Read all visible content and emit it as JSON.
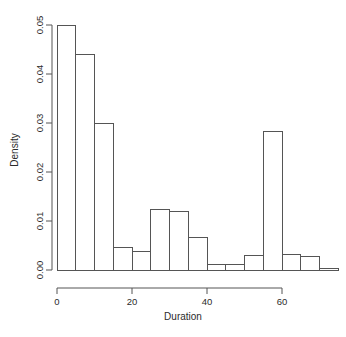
{
  "chart_data": {
    "type": "bar",
    "subtype": "histogram",
    "title": "",
    "xlabel": "Duration",
    "ylabel": "Density",
    "xlim": [
      0,
      75
    ],
    "ylim": [
      0,
      0.05
    ],
    "grid": false,
    "legend": null,
    "bin_width": 5,
    "bar_fill": "#ffffff",
    "bar_stroke": "#555555",
    "axis_color": "#555555",
    "xticks": [
      0,
      20,
      40,
      60
    ],
    "xtick_labels": [
      "0",
      "20",
      "40",
      "60"
    ],
    "yticks": [
      0,
      0.01,
      0.02,
      0.03,
      0.04,
      0.05
    ],
    "ytick_labels": [
      "0.00",
      "0.01",
      "0.02",
      "0.03",
      "0.04",
      "0.05"
    ],
    "bins": [
      {
        "x0": 0,
        "x1": 5,
        "density": 0.05
      },
      {
        "x0": 5,
        "x1": 10,
        "density": 0.044
      },
      {
        "x0": 10,
        "x1": 15,
        "density": 0.03
      },
      {
        "x0": 15,
        "x1": 20,
        "density": 0.0045
      },
      {
        "x0": 20,
        "x1": 25,
        "density": 0.0037
      },
      {
        "x0": 25,
        "x1": 30,
        "density": 0.0124
      },
      {
        "x0": 30,
        "x1": 35,
        "density": 0.012
      },
      {
        "x0": 35,
        "x1": 40,
        "density": 0.0067
      },
      {
        "x0": 40,
        "x1": 45,
        "density": 0.0011
      },
      {
        "x0": 45,
        "x1": 50,
        "density": 0.0012
      },
      {
        "x0": 50,
        "x1": 55,
        "density": 0.003
      },
      {
        "x0": 55,
        "x1": 60,
        "density": 0.0283
      },
      {
        "x0": 60,
        "x1": 65,
        "density": 0.0032
      },
      {
        "x0": 65,
        "x1": 70,
        "density": 0.0027
      },
      {
        "x0": 70,
        "x1": 75,
        "density": 0.0004
      }
    ],
    "categories": [
      "0-5",
      "5-10",
      "10-15",
      "15-20",
      "20-25",
      "25-30",
      "30-35",
      "35-40",
      "40-45",
      "45-50",
      "50-55",
      "55-60",
      "60-65",
      "65-70",
      "70-75"
    ],
    "values": [
      0.05,
      0.044,
      0.03,
      0.0045,
      0.0037,
      0.0124,
      0.012,
      0.0067,
      0.0011,
      0.0012,
      0.003,
      0.0283,
      0.0032,
      0.0027,
      0.0004
    ]
  },
  "plot_geometry": {
    "x_origin_px": 57,
    "px_per_x_unit": 3.75,
    "y_zero_px": 270,
    "px_per_density": 4900,
    "x_axis_line_y": 288,
    "y_axis_line_x": 52,
    "y_axis_top_px": 25
  }
}
